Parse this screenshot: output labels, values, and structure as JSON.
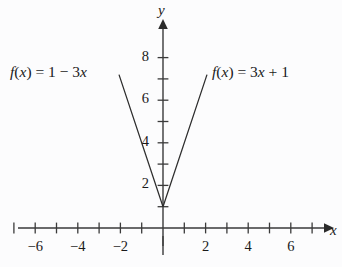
{
  "figure": {
    "background_color": "#fcfcfd",
    "ink_color": "#3a3a3a",
    "text_color": "#1a1a1a",
    "width": 342,
    "height": 267
  },
  "axes": {
    "x_axis_name": "x",
    "y_axis_name": "y",
    "origin_px": {
      "x": 163,
      "y": 228
    },
    "unit_px": 21.3
  },
  "labels": {
    "left_function_text": "f(x) = 1 − 3x",
    "right_function_text": "f(x) = 3x + 1",
    "left_function_parts": {
      "f": "f",
      "open": "(",
      "var": "x",
      "close": ")",
      "equals": "=",
      "intercept": "1",
      "operator": "−",
      "slope": "3",
      "slope_var": "x"
    },
    "right_function_parts": {
      "f": "f",
      "open": "(",
      "var": "x",
      "close": ")",
      "equals": "=",
      "slope": "3",
      "slope_var": "x",
      "operator": "+",
      "intercept": "1"
    }
  },
  "chart_data": {
    "type": "line",
    "title": "",
    "xlabel": "x",
    "ylabel": "y",
    "xlim": [
      -7.6,
      7.8
    ],
    "ylim": [
      -1.6,
      9.4
    ],
    "grid": false,
    "legend": "inline-annotations",
    "x_tick_values": [
      -7,
      -6,
      -5,
      -4,
      -3,
      -2,
      -1,
      1,
      2,
      3,
      4,
      5,
      6,
      7
    ],
    "x_tick_labels": [
      {
        "value": -6,
        "text": "−6"
      },
      {
        "value": -4,
        "text": "−4"
      },
      {
        "value": -2,
        "text": "−2"
      },
      {
        "value": 2,
        "text": "2"
      },
      {
        "value": 4,
        "text": "4"
      },
      {
        "value": 6,
        "text": "6"
      }
    ],
    "y_tick_values": [
      1,
      2,
      3,
      4,
      5,
      6,
      7,
      8
    ],
    "y_tick_labels": [
      {
        "value": 2,
        "text": "2"
      },
      {
        "value": 4,
        "text": "4"
      },
      {
        "value": 6,
        "text": "6"
      },
      {
        "value": 8,
        "text": "8"
      }
    ],
    "series": [
      {
        "name": "f(x) = 1 − 3x",
        "label": "f(x) = 1 − 3x",
        "slope": -3,
        "intercept": 1,
        "x": [
          -2.07,
          0
        ],
        "y": [
          7.2,
          1
        ],
        "endpoints": [
          {
            "x": -2.07,
            "y": 7.2
          },
          {
            "x": 0,
            "y": 1
          }
        ]
      },
      {
        "name": "f(x) = 3x + 1",
        "label": "f(x) = 3x + 1",
        "slope": 3,
        "intercept": 1,
        "x": [
          0,
          2.07
        ],
        "y": [
          1,
          7.2
        ],
        "endpoints": [
          {
            "x": 0,
            "y": 1
          },
          {
            "x": 2.07,
            "y": 7.2
          }
        ]
      }
    ],
    "intersection": {
      "x": 0,
      "y": 1
    }
  }
}
